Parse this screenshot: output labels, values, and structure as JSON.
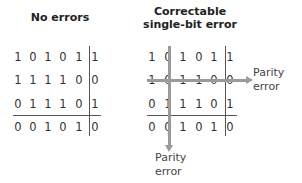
{
  "left_panel": {
    "title": "No errors",
    "rows": [
      [
        "1",
        "0",
        "1",
        "0",
        "1",
        "1"
      ],
      [
        "1",
        "1",
        "1",
        "1",
        "0",
        "0"
      ],
      [
        "0",
        "1",
        "1",
        "1",
        "0",
        "1"
      ],
      [
        "0",
        "0",
        "1",
        "0",
        "1",
        "0"
      ]
    ]
  },
  "right_panel": {
    "title_line1": "Correctable",
    "title_line2": "single-bit error",
    "rows": [
      [
        "1",
        "0",
        "1",
        "0",
        "1",
        "1"
      ],
      [
        "1",
        "0",
        "1",
        "1",
        "0",
        "0"
      ],
      [
        "0",
        "1",
        "1",
        "1",
        "0",
        "1"
      ],
      [
        "0",
        "0",
        "1",
        "0",
        "1",
        "0"
      ]
    ],
    "row_parity_label_line1": "Parity",
    "row_parity_label_line2": "error",
    "col_parity_label_line1": "Parity",
    "col_parity_label_line2": "error"
  },
  "colors": {
    "arrow": "#9a9a9a",
    "text": "#333333",
    "divider": "#555555"
  }
}
